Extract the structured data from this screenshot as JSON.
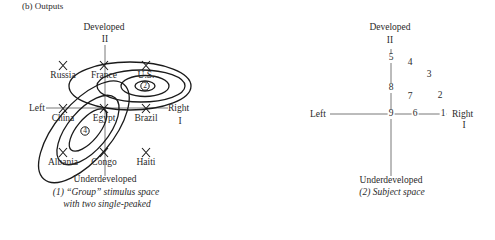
{
  "heading": "(b) Outputs",
  "left_panel": {
    "axis_top_label": "Developed",
    "axis_top_numeral": "II",
    "axis_bottom_label": "Underdeveloped",
    "axis_left_label": "Left",
    "axis_right_label": "Right",
    "axis_right_numeral": "I",
    "stimuli": [
      {
        "name": "Russia",
        "x": 63,
        "y": 65
      },
      {
        "name": "France",
        "x": 104,
        "y": 65
      },
      {
        "name": "U.S.",
        "x": 146,
        "y": 65
      },
      {
        "name": "China",
        "x": 63,
        "y": 108
      },
      {
        "name": "Egypt",
        "x": 104,
        "y": 108
      },
      {
        "name": "Brazil",
        "x": 146,
        "y": 108
      },
      {
        "name": "Albania",
        "x": 63,
        "y": 152
      },
      {
        "name": "Congo",
        "x": 104,
        "y": 152
      },
      {
        "name": "Haiti",
        "x": 146,
        "y": 152
      }
    ],
    "ideal_points": [
      {
        "label": "2",
        "x": 145,
        "y": 86
      },
      {
        "label": "4",
        "x": 85,
        "y": 131
      }
    ],
    "caption_line1": "(1) “Group” stimulus space",
    "caption_line2": "with two single-peaked"
  },
  "right_panel": {
    "axis_top_label": "Developed",
    "axis_top_numeral": "II",
    "axis_bottom_label": "Underdeveloped",
    "axis_left_label": "Left",
    "axis_right_label": "Right",
    "axis_right_numeral": "I",
    "subjects": [
      {
        "label": "5",
        "x": 391,
        "y": 58
      },
      {
        "label": "4",
        "x": 410,
        "y": 63
      },
      {
        "label": "3",
        "x": 429,
        "y": 75
      },
      {
        "label": "8",
        "x": 391,
        "y": 88
      },
      {
        "label": "7",
        "x": 410,
        "y": 97
      },
      {
        "label": "2",
        "x": 440,
        "y": 96
      },
      {
        "label": "9",
        "x": 391,
        "y": 114
      },
      {
        "label": "6",
        "x": 415,
        "y": 114
      },
      {
        "label": "1",
        "x": 443,
        "y": 114
      }
    ],
    "caption": "(2) Subject space"
  }
}
